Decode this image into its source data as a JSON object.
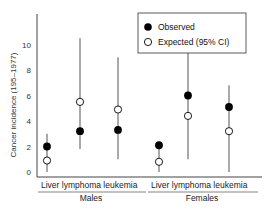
{
  "chart_data": {
    "type": "scatter",
    "title": "",
    "xlabel": "",
    "ylabel": "Cancer incidence (195–1977)",
    "ylim": [
      0,
      10
    ],
    "yticks": [
      0,
      2,
      4,
      6,
      8,
      10
    ],
    "grid": false,
    "legend_position": "upper right",
    "groups": [
      "Males",
      "Females"
    ],
    "categories": [
      "Liver",
      "lymphoma",
      "leukemia",
      "Liver",
      "lymphoma",
      "leukemia"
    ],
    "category_group": [
      "Males",
      "Males",
      "Males",
      "Females",
      "Females",
      "Females"
    ],
    "series": [
      {
        "name": "Observed",
        "marker": "filled-circle",
        "values": [
          2.0,
          3.2,
          3.3,
          2.1,
          6.0,
          5.1
        ]
      },
      {
        "name": "Expected (95% CI)",
        "marker": "open-circle",
        "values": [
          0.9,
          5.5,
          4.9,
          0.8,
          4.4,
          3.2
        ],
        "ci_low": [
          0.0,
          1.8,
          1.0,
          0.0,
          1.0,
          0.0
        ],
        "ci_high": [
          3.0,
          10.5,
          9.0,
          2.2,
          10.5,
          6.8
        ]
      }
    ]
  },
  "legend": {
    "observed_label": "Observed",
    "expected_label": "Expected (95% CI)"
  },
  "axis": {
    "ylabel": "Cancer incidence (195–1977)",
    "tick_labels": [
      "0",
      "2",
      "4",
      "6",
      "8",
      "10"
    ]
  },
  "xaxis": {
    "males_categories": "Liver lymphoma leukemia",
    "females_categories": "Liver lymphoma leukemia",
    "males_label": "Males",
    "females_label": "Females"
  },
  "colors": {
    "axis": "#444444",
    "errorbar": "#555555",
    "observed": "#000000",
    "expected_fill": "#ffffff"
  }
}
